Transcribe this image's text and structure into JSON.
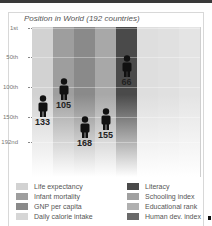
{
  "chart_data": {
    "type": "bar",
    "title": "Position in World (192 countries)",
    "ylabel": "Rank",
    "yticks": [
      "1st",
      "50th",
      "100th",
      "150th",
      "192nd"
    ],
    "ylim": [
      1,
      192
    ],
    "categories": [
      "Life expectancy",
      "Infant mortality",
      "GNP per capita",
      "Daily calorie intake",
      "Literacy",
      "Schooling index",
      "Educational rank",
      "Human dev. index"
    ],
    "values": [
      133,
      105,
      168,
      155,
      66,
      null,
      null,
      null
    ],
    "colors": [
      "#d2d2d2",
      "#9e9e9e",
      "#8a8a8a",
      "#a8a8a8",
      "#4a4a4a",
      "#dedede",
      "#e0e0e0",
      "#e4e4e4"
    ],
    "legend_position": "bottom"
  },
  "legend": [
    {
      "label": "Life expectancy",
      "color": "#d2d2d2"
    },
    {
      "label": "Infant mortality",
      "color": "#9e9e9e"
    },
    {
      "label": "GNP per capita",
      "color": "#8a8a8a"
    },
    {
      "label": "Daily calorie intake",
      "color": "#d6d6d6"
    },
    {
      "label": "Literacy",
      "color": "#4a4a4a"
    },
    {
      "label": "Schooling index",
      "color": "#a0a0a0"
    },
    {
      "label": "Educational rank",
      "color": "#b0b0b0"
    },
    {
      "label": "Human dev. index",
      "color": "#6a6a6a"
    }
  ]
}
